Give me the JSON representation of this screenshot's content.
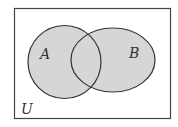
{
  "diagram": {
    "type": "venn",
    "universe_label": "U",
    "sets": [
      {
        "label": "A",
        "shaded": true
      },
      {
        "label": "B",
        "shaded": true
      }
    ],
    "colors": {
      "fill": "#d6d6d6",
      "stroke": "#333333",
      "background": "#ffffff"
    }
  }
}
